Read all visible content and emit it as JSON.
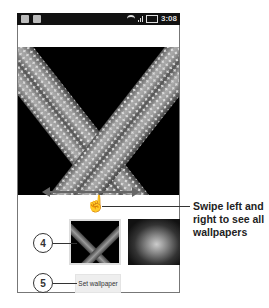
{
  "status_bar": {
    "time": "3:08",
    "left_icons": [
      "notification-icon",
      "usb-icon"
    ],
    "right_icons": [
      "wifi-icon",
      "signal-icon",
      "battery-icon"
    ]
  },
  "preview": {
    "description": "Wallpaper preview with crossed metallic bars"
  },
  "gesture": {
    "arrow": "double-headed-arrow",
    "hand": "swipe-hand-icon"
  },
  "thumbnails": [
    {
      "name": "crossed-bars-wallpaper",
      "selected": true
    },
    {
      "name": "nebula-wallpaper",
      "selected": false
    }
  ],
  "set_button": {
    "label": "Set wallpaper"
  },
  "callouts": {
    "swipe_text": "Swipe left and right to see all wallpapers",
    "step4": "4",
    "step5": "5"
  }
}
